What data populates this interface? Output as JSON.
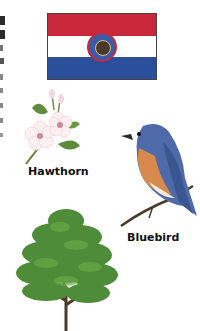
{
  "fragments": {
    "left_edge_text": "cropped text fragments at left margin"
  },
  "flag": {
    "name": "Missouri state flag",
    "colors": {
      "top": "#c8283a",
      "middle": "#ffffff",
      "bottom": "#2c4f9c"
    }
  },
  "hawthorn": {
    "label": "Hawthorn"
  },
  "bluebird": {
    "label": "Bluebird"
  },
  "tree": {
    "label": ""
  }
}
